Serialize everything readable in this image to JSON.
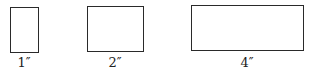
{
  "figures": [
    {
      "id": "rect-1",
      "label": "1″",
      "box": {
        "left": 10,
        "top": 7,
        "width": 29,
        "height": 46
      }
    },
    {
      "id": "rect-2",
      "label": "2″",
      "box": {
        "left": 87,
        "top": 6,
        "width": 57,
        "height": 46
      }
    },
    {
      "id": "rect-3",
      "label": "4″",
      "box": {
        "left": 191,
        "top": 5,
        "width": 113,
        "height": 46
      }
    }
  ],
  "colors": {
    "stroke": "#2a2a2a",
    "text": "#222222",
    "background": "#ffffff"
  }
}
